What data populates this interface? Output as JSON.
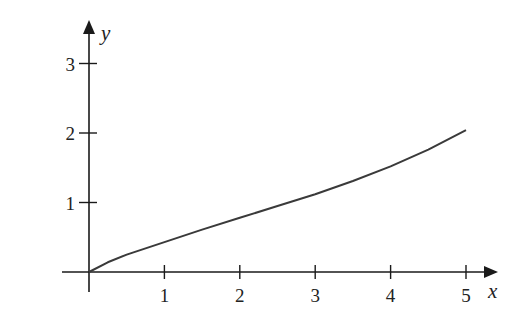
{
  "chart_data": {
    "type": "line",
    "title": "",
    "xlabel": "x",
    "ylabel": "y",
    "xlim": [
      0,
      5.3
    ],
    "ylim": [
      0,
      3.5
    ],
    "x_ticks": [
      "1",
      "2",
      "3",
      "4",
      "5"
    ],
    "y_ticks": [
      "1",
      "2",
      "3"
    ],
    "grid": false,
    "legend": null,
    "series": [
      {
        "name": "curve",
        "x": [
          0,
          0.25,
          0.5,
          1,
          1.5,
          2,
          2.5,
          3,
          3.5,
          4,
          4.5,
          5
        ],
        "y": [
          0,
          0.14,
          0.25,
          0.43,
          0.61,
          0.78,
          0.95,
          1.12,
          1.31,
          1.52,
          1.76,
          2.04
        ]
      }
    ],
    "colors": {
      "axis": "#1a1a1a",
      "curve": "#3a3a3a"
    }
  }
}
